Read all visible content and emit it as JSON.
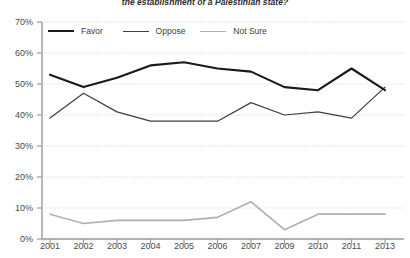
{
  "chart": {
    "title": "the establishment of a Palestinian state?"
  },
  "legend": {
    "items": [
      {
        "label": "Favor",
        "color": "#1a1a1a",
        "width": 2.2
      },
      {
        "label": "Oppose",
        "color": "#3f3f3f",
        "width": 1.2
      },
      {
        "label": "Not Sure",
        "color": "#b0b0b0",
        "width": 1.6
      }
    ]
  },
  "chart_data": {
    "type": "line",
    "title": "the establishment of a Palestinian state?",
    "xlabel": "",
    "ylabel": "",
    "grid": true,
    "legend_position": "top-left",
    "ylim": [
      0,
      70
    ],
    "ytick_labels": [
      "0%",
      "10%",
      "20%",
      "30%",
      "40%",
      "50%",
      "60%",
      "70%"
    ],
    "ytick_values": [
      0,
      10,
      20,
      30,
      40,
      50,
      60,
      70
    ],
    "categories": [
      "2001",
      "2002",
      "2003",
      "2004",
      "2005",
      "2006",
      "2007",
      "2009",
      "2010",
      "2011",
      "2013"
    ],
    "series": [
      {
        "name": "Favor",
        "color": "#1a1a1a",
        "values": [
          53,
          49,
          52,
          56,
          57,
          55,
          54,
          49,
          48,
          55,
          48
        ]
      },
      {
        "name": "Oppose",
        "color": "#3f3f3f",
        "values": [
          39,
          47,
          41,
          38,
          38,
          38,
          44,
          40,
          41,
          39,
          49
        ]
      },
      {
        "name": "Not Sure",
        "color": "#b0b0b0",
        "values": [
          8,
          5,
          6,
          6,
          6,
          7,
          12,
          3,
          8,
          8,
          8
        ]
      }
    ]
  }
}
